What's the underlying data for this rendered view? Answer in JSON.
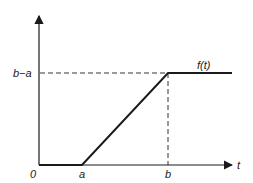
{
  "diagram": {
    "title": "",
    "function_label": "f(t)",
    "x_axis_label": "t",
    "origin_label": "0",
    "x_tick_labels": [
      "a",
      "b"
    ],
    "y_tick_labels": [
      "b−a"
    ],
    "segments": [
      {
        "name": "zero-segment",
        "from": {
          "t": "0",
          "f": "0"
        },
        "to": {
          "t": "a",
          "f": "0"
        }
      },
      {
        "name": "ramp-segment",
        "from": {
          "t": "a",
          "f": "0"
        },
        "to": {
          "t": "b",
          "f": "b−a"
        }
      },
      {
        "name": "plateau-segment",
        "from": {
          "t": "b",
          "f": "b−a"
        },
        "to": {
          "t": "∞",
          "f": "b−a"
        }
      }
    ],
    "guides": [
      "horizontal dashed line at f=b−a",
      "vertical dashed line at t=b"
    ],
    "colors": {
      "line": "#1a1a1a",
      "dashed": "#333333"
    }
  }
}
